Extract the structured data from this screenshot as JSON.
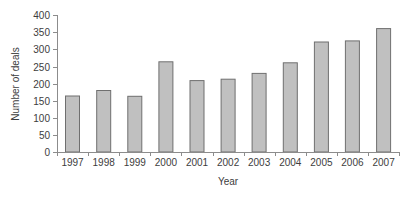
{
  "colors": {
    "background": "#ffffff",
    "bar_fill": "#c0c0c0",
    "bar_border": "#6f6f6f",
    "axis_line": "#8c8c8c",
    "text": "#3d3d3d"
  },
  "chart_data": {
    "type": "bar",
    "title": "",
    "xlabel": "Year",
    "ylabel": "Number of deals",
    "categories": [
      "1997",
      "1998",
      "1999",
      "2000",
      "2001",
      "2002",
      "2003",
      "2004",
      "2005",
      "2006",
      "2007"
    ],
    "values": [
      164,
      180,
      163,
      264,
      209,
      213,
      230,
      261,
      322,
      325,
      361
    ],
    "ylim": [
      0,
      400
    ],
    "yticks": [
      0,
      50,
      100,
      150,
      200,
      250,
      300,
      350,
      400
    ],
    "grid": false,
    "legend": null,
    "legend_position": "none"
  }
}
